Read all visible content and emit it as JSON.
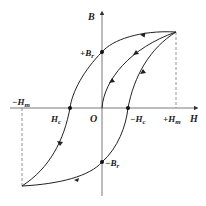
{
  "diagram": {
    "type": "hysteresis-loop",
    "axes": {
      "x_label": "H",
      "y_label": "B",
      "origin_label": "O"
    },
    "points": {
      "plus_Hm": {
        "main": "+H",
        "sub": "m"
      },
      "minus_Hm": {
        "main": "−H",
        "sub": "m"
      },
      "Hc": {
        "main": "H",
        "sub": "c"
      },
      "minus_Hc": {
        "main": "−H",
        "sub": "c"
      },
      "plus_Br": {
        "main": "+B",
        "sub": "r"
      },
      "minus_Br": {
        "main": "−B",
        "sub": "r"
      }
    },
    "colors": {
      "line": "#222222",
      "axis": "#555555",
      "dashed": "#777777"
    }
  }
}
